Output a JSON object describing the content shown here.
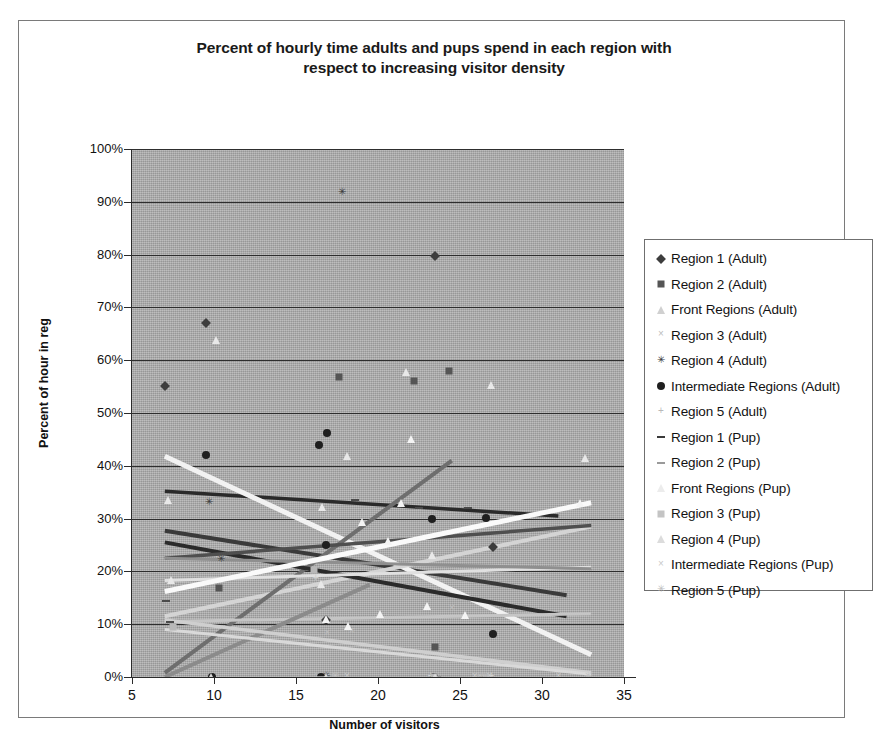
{
  "chart_data": {
    "type": "scatter",
    "title": "Percent of hourly time adults and pups spend in each region with respect to increasing visitor density",
    "title_lines": [
      "Percent of hourly time adults and pups spend in each region with",
      "respect to increasing visitor density"
    ],
    "xlabel": "Number of visitors",
    "ylabel": "Percent of hour in reg",
    "xlim": [
      5,
      35
    ],
    "ylim": [
      0,
      1
    ],
    "xticks": [
      "5",
      "10",
      "15",
      "20",
      "25",
      "30",
      "35"
    ],
    "xtick_values": [
      5,
      10,
      15,
      20,
      25,
      30,
      35
    ],
    "yticks": [
      "0%",
      "10%",
      "20%",
      "30%",
      "40%",
      "50%",
      "60%",
      "70%",
      "80%",
      "90%",
      "100%"
    ],
    "ytick_values": [
      0,
      0.1,
      0.2,
      0.3,
      0.4,
      0.5,
      0.6,
      0.7,
      0.8,
      0.9,
      1.0
    ],
    "grid": "horizontal",
    "plot_background": "#a9a9a9",
    "legend_position": "right-outside",
    "series": [
      {
        "name": "Region 1 (Adult)",
        "marker": "diamond",
        "color": "#3d3d3d",
        "points": [
          [
            7,
            0.552
          ],
          [
            9.5,
            0.671
          ],
          [
            23.5,
            0.797
          ],
          [
            16.8,
            0.108
          ],
          [
            27,
            0.246
          ]
        ],
        "trend": {
          "x0": 7,
          "y0": 0.352,
          "x1": 31,
          "y1": 0.305,
          "color": "#2a2a2a",
          "width": 3.5
        }
      },
      {
        "name": "Region 2 (Adult)",
        "marker": "square",
        "color": "#555555",
        "points": [
          [
            22.2,
            0.561
          ],
          [
            24.3,
            0.579
          ],
          [
            17.6,
            0.568
          ],
          [
            10.3,
            0.168
          ],
          [
            23.5,
            0.056
          ]
        ],
        "trend": {
          "x0": 7,
          "y0": 0.277,
          "x1": 31.5,
          "y1": 0.155,
          "color": "#3a3a3a",
          "width": 4
        }
      },
      {
        "name": "Front Regions (Adult)",
        "marker": "triangle",
        "color": "#e8e8e8",
        "points": [
          [
            10.1,
            0.639
          ],
          [
            21.7,
            0.577
          ],
          [
            18.1,
            0.418
          ],
          [
            32.6,
            0.414
          ],
          [
            7.2,
            0.335
          ],
          [
            16.6,
            0.322
          ],
          [
            16.5,
            0.176
          ],
          [
            7.4,
            0.183
          ],
          [
            26.9,
            0.553
          ],
          [
            23.3,
            0.232
          ]
        ],
        "trend": {
          "x0": 7,
          "y0": 0.418,
          "x1": 33,
          "y1": 0.042,
          "color": "#f2f2f2",
          "width": 5
        }
      },
      {
        "name": "Region 3 (Adult)",
        "marker": "cross",
        "color": "#bdbdbd",
        "points": [
          [
            16.9,
            0.082
          ],
          [
            18.4,
            0.085
          ],
          [
            24.5,
            0.128
          ],
          [
            16.3,
            0.0
          ]
        ],
        "trend": {
          "x0": 7,
          "y0": 0.115,
          "x1": 33,
          "y1": 0.285,
          "color": "#d4d4d4",
          "width": 4
        }
      },
      {
        "name": "Region 4 (Adult)",
        "marker": "star",
        "color": "#3a3a3a",
        "points": [
          [
            17.8,
            0.916
          ],
          [
            9.7,
            0.33
          ],
          [
            10.4,
            0.222
          ],
          [
            16.8,
            0.0
          ]
        ],
        "trend": {
          "x0": 7,
          "y0": 0.008,
          "x1": 24.5,
          "y1": 0.41,
          "color": "#6e6e6e",
          "width": 4
        }
      },
      {
        "name": "Intermediate Regions (Adult)",
        "marker": "circle",
        "color": "#1f1f1f",
        "points": [
          [
            9.5,
            0.42
          ],
          [
            16.9,
            0.463
          ],
          [
            16.4,
            0.44
          ],
          [
            16.8,
            0.25
          ],
          [
            23.3,
            0.3
          ],
          [
            26.6,
            0.301
          ],
          [
            27.0,
            0.082
          ],
          [
            9.9,
            0.0
          ],
          [
            16.5,
            0.0
          ],
          [
            23.4,
            0.0
          ]
        ],
        "trend": {
          "x0": 7,
          "y0": 0.255,
          "x1": 31.5,
          "y1": 0.115,
          "color": "#2b2b2b",
          "width": 4
        }
      },
      {
        "name": "Region 5 (Adult)",
        "marker": "plus",
        "color": "#cfcfcf",
        "points": [
          [
            16.2,
            0.185
          ],
          [
            23.2,
            0.0
          ],
          [
            26.9,
            0.0
          ]
        ],
        "trend": {
          "x0": 7,
          "y0": 0.183,
          "x1": 33,
          "y1": 0.208,
          "color": "#e0e0e0",
          "width": 3
        }
      },
      {
        "name": "Region 1 (Pup)",
        "marker": "dash",
        "color": "#4a4a4a",
        "points": [
          [
            7.1,
            0.143
          ],
          [
            22.5,
            0.321
          ],
          [
            25.5,
            0.321
          ],
          [
            18.6,
            0.336
          ],
          [
            7.3,
            0.105
          ]
        ],
        "trend": {
          "x0": 7,
          "y0": 0.225,
          "x1": 33,
          "y1": 0.287,
          "color": "#4f4f4f",
          "width": 3.5
        }
      },
      {
        "name": "Region 2 (Pup)",
        "marker": "dash-light",
        "color": "#9a9a9a",
        "points": [
          [
            23.6,
            0.0
          ],
          [
            16.5,
            0.0
          ],
          [
            26.4,
            0.0
          ]
        ],
        "trend": {
          "x0": 7,
          "y0": 0.225,
          "x1": 33,
          "y1": 0.205,
          "color": "#8f8f8f",
          "width": 3
        }
      },
      {
        "name": "Front Regions (Pup)",
        "marker": "triangle-light",
        "color": "#f4f4f4",
        "points": [
          [
            22.0,
            0.45
          ],
          [
            19.0,
            0.293
          ],
          [
            20.6,
            0.258
          ],
          [
            23.0,
            0.135
          ],
          [
            20.1,
            0.119
          ],
          [
            25.3,
            0.118
          ],
          [
            18.2,
            0.096
          ],
          [
            16.8,
            0.11
          ],
          [
            21.4,
            0.33
          ],
          [
            32.3,
            0.33
          ]
        ],
        "trend": {
          "x0": 7,
          "y0": 0.162,
          "x1": 33,
          "y1": 0.33,
          "color": "#fafafa",
          "width": 5
        }
      },
      {
        "name": "Region 3 (Pup)",
        "marker": "square-light",
        "color": "#b8b8b8",
        "points": [
          [
            7.5,
            0.095
          ],
          [
            16.1,
            0.203
          ],
          [
            23.4,
            0.0
          ],
          [
            26.6,
            0.0
          ]
        ],
        "trend": {
          "x0": 7,
          "y0": 0.105,
          "x1": 33,
          "y1": 0.12,
          "color": "#c5c5c5",
          "width": 3
        }
      },
      {
        "name": "Region 4 (Pup)",
        "marker": "triangle-mid",
        "color": "#d8d8d8",
        "points": [
          [
            16.8,
            0.0
          ],
          [
            23.5,
            0.0
          ],
          [
            9.8,
            0.0
          ]
        ],
        "trend": {
          "x0": 7,
          "y0": 0.0,
          "x1": 19.5,
          "y1": 0.175,
          "color": "#8b8b8b",
          "width": 4
        }
      },
      {
        "name": "Intermediate Regions (Pup)",
        "marker": "cross-light",
        "color": "#c9c9c9",
        "points": [
          [
            18.1,
            0.0
          ],
          [
            25.9,
            0.0
          ],
          [
            26.8,
            0.0
          ],
          [
            31.0,
            0.0
          ]
        ],
        "trend": {
          "x0": 7,
          "y0": 0.108,
          "x1": 33,
          "y1": 0.008,
          "color": "#cfcfcf",
          "width": 3.5
        }
      },
      {
        "name": "Region 5 (Pup)",
        "marker": "star-light",
        "color": "#bfbfbf",
        "points": [
          [
            17.4,
            0.0
          ],
          [
            26.2,
            0.0
          ],
          [
            32.8,
            0.0
          ]
        ],
        "trend": {
          "x0": 7,
          "y0": 0.09,
          "x1": 33,
          "y1": 0.005,
          "color": "#d9d9d9",
          "width": 3
        }
      }
    ]
  },
  "legend": {
    "items": [
      {
        "label": "Region 1 (Adult)",
        "marker": "diamond",
        "color": "#3d3d3d"
      },
      {
        "label": "Region 2 (Adult)",
        "marker": "square",
        "color": "#555555"
      },
      {
        "label": "Front Regions (Adult)",
        "marker": "triangle",
        "color": "#d0d0d0"
      },
      {
        "label": "Region 3 (Adult)",
        "marker": "cross",
        "color": "#bdbdbd"
      },
      {
        "label": "Region 4 (Adult)",
        "marker": "star",
        "color": "#3a3a3a"
      },
      {
        "label": "Intermediate Regions (Adult)",
        "marker": "circle",
        "color": "#1f1f1f"
      },
      {
        "label": "Region 5 (Adult)",
        "marker": "plus",
        "color": "#b8b8b8"
      },
      {
        "label": "Region 1 (Pup)",
        "marker": "dash",
        "color": "#3a3a3a"
      },
      {
        "label": "Region 2 (Pup)",
        "marker": "dash-light",
        "color": "#9a9a9a"
      },
      {
        "label": "Front Regions (Pup)",
        "marker": "triangle-light",
        "color": "#ececec"
      },
      {
        "label": "Region 3 (Pup)",
        "marker": "square-light",
        "color": "#c4c4c4"
      },
      {
        "label": "Region 4 (Pup)",
        "marker": "triangle-mid",
        "color": "#dcdcdc"
      },
      {
        "label": "Intermediate Regions (Pup)",
        "marker": "cross-light",
        "color": "#c9c9c9"
      },
      {
        "label": "Region 5 (Pup)",
        "marker": "star-light",
        "color": "#bfbfbf"
      }
    ]
  }
}
